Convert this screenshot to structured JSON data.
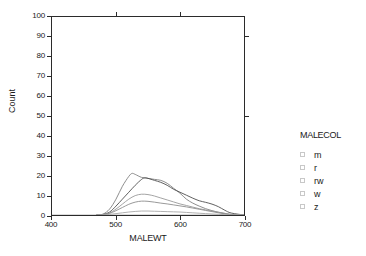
{
  "chart_data": {
    "type": "line",
    "title": "",
    "xlabel": "MALEWT",
    "ylabel": "Count",
    "xlim": [
      400,
      700
    ],
    "ylim": [
      0,
      100
    ],
    "xticks": [
      400,
      500,
      600,
      700
    ],
    "yticks": [
      0,
      10,
      20,
      30,
      40,
      50,
      60,
      70,
      80,
      90,
      100
    ],
    "grid": false,
    "legend_position": "right",
    "legend_title": "MALECOL",
    "series": [
      {
        "name": "m",
        "color": "#808080",
        "x": [
          470,
          480,
          490,
          500,
          510,
          520,
          525,
          530,
          540,
          550,
          560,
          570,
          580,
          590,
          600,
          610,
          620,
          630,
          640,
          650,
          660,
          670,
          680,
          700
        ],
        "values": [
          0,
          0.5,
          3,
          8,
          14.5,
          19.5,
          21,
          20.5,
          19,
          18.5,
          18,
          17.5,
          16,
          13.5,
          11,
          8,
          6,
          4.5,
          3.2,
          2.2,
          1.4,
          0.8,
          0.3,
          0
        ]
      },
      {
        "name": "r",
        "color": "#4d4d4d",
        "x": [
          470,
          480,
          490,
          500,
          510,
          520,
          530,
          540,
          545,
          550,
          560,
          570,
          580,
          590,
          600,
          610,
          620,
          630,
          640,
          650,
          660,
          670,
          680,
          700
        ],
        "values": [
          0,
          0.3,
          1.5,
          4.5,
          8,
          11.5,
          15,
          18,
          18.8,
          18.5,
          17.5,
          16.5,
          15,
          13,
          11.5,
          10,
          8.5,
          7.2,
          6.4,
          5.5,
          4.2,
          2.4,
          1,
          0
        ]
      },
      {
        "name": "rw",
        "color": "#999999",
        "x": [
          470,
          480,
          490,
          500,
          510,
          520,
          530,
          540,
          550,
          560,
          570,
          580,
          590,
          600,
          610,
          620,
          630,
          640,
          650,
          660,
          670,
          680,
          700
        ],
        "values": [
          0,
          0.2,
          1,
          3,
          5.5,
          8,
          9.8,
          10.5,
          10.3,
          9.6,
          8.6,
          7.6,
          6.6,
          5.6,
          4.8,
          4,
          3.2,
          2.6,
          2,
          1.4,
          0.8,
          0.3,
          0
        ]
      },
      {
        "name": "w",
        "color": "#8c8c8c",
        "x": [
          470,
          480,
          490,
          500,
          510,
          520,
          530,
          540,
          550,
          560,
          570,
          580,
          590,
          600,
          610,
          620,
          630,
          640,
          650,
          660,
          670,
          680,
          700
        ],
        "values": [
          0,
          0.2,
          0.8,
          2.2,
          3.8,
          5.4,
          6.5,
          7,
          6.9,
          6.5,
          6,
          5.6,
          5.1,
          4.6,
          4.1,
          3.5,
          2.9,
          2.3,
          1.7,
          1.1,
          0.6,
          0.2,
          0
        ]
      },
      {
        "name": "z",
        "color": "#a6a6a6",
        "x": [
          470,
          480,
          490,
          500,
          510,
          520,
          530,
          540,
          550,
          560,
          570,
          580,
          590,
          600,
          610,
          620,
          630,
          640,
          650,
          660,
          670,
          680,
          700
        ],
        "values": [
          0,
          0.1,
          0.3,
          0.7,
          1.1,
          1.5,
          1.8,
          2.0,
          2.0,
          1.9,
          1.8,
          1.7,
          1.6,
          1.5,
          1.3,
          1.1,
          0.9,
          0.7,
          0.5,
          0.35,
          0.2,
          0.1,
          0
        ]
      }
    ]
  },
  "axes": {
    "y_title": "Count",
    "x_title": "MALEWT",
    "y_tick_labels": [
      "100",
      "90",
      "80",
      "70",
      "60",
      "50",
      "40",
      "30",
      "20",
      "10",
      "0"
    ],
    "x_tick_labels": [
      "400",
      "500",
      "600",
      "700"
    ]
  },
  "legend": {
    "title": "MALECOL",
    "items": [
      {
        "label": "m"
      },
      {
        "label": "r"
      },
      {
        "label": "rw"
      },
      {
        "label": "w"
      },
      {
        "label": "z"
      }
    ]
  }
}
